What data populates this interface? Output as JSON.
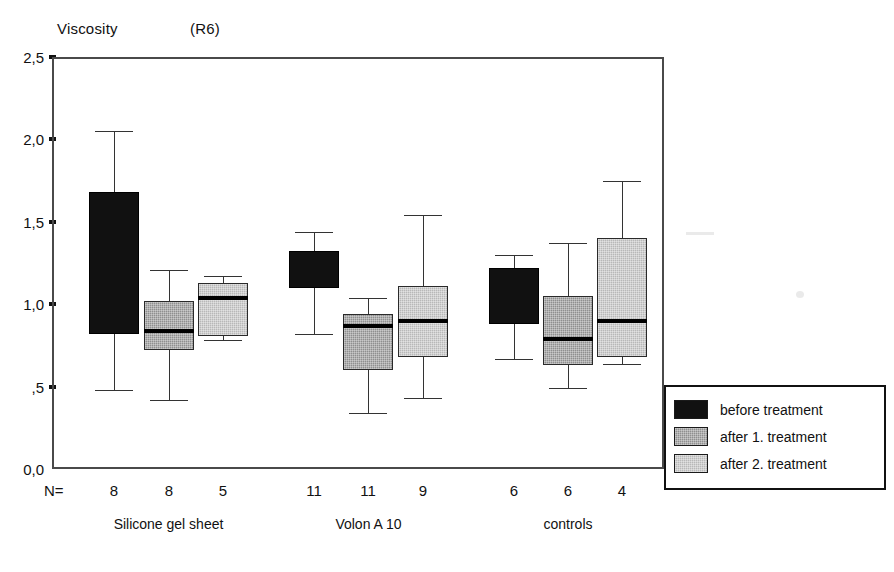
{
  "chart_data": {
    "type": "box",
    "title": "Viscosity",
    "title_suffix": "(R6)",
    "xlabel": "",
    "ylabel": "",
    "ylim": [
      0.0,
      2.5
    ],
    "ytick_labels": [
      "2,5",
      "2,0",
      "1,5",
      "1,0",
      ",5",
      "0,0"
    ],
    "ytick_values": [
      2.5,
      2.0,
      1.5,
      1.0,
      0.5,
      0.0
    ],
    "grid": false,
    "legend_position": "right",
    "n_row_label": "N=",
    "categories": [
      "Silicone gel sheet",
      "Volon A 10",
      "controls"
    ],
    "series": [
      {
        "name": "before treatment",
        "swatch": "dark"
      },
      {
        "name": "after 1. treatment",
        "swatch": "mid"
      },
      {
        "name": "after 2. treatment",
        "swatch": "light"
      }
    ],
    "boxes": [
      {
        "group": "Silicone gel sheet",
        "series": "before treatment",
        "n": "8",
        "whisker_low": 0.48,
        "q1": 0.82,
        "median": 0.82,
        "q3": 1.68,
        "whisker_high": 2.05,
        "style": "dark"
      },
      {
        "group": "Silicone gel sheet",
        "series": "after 1. treatment",
        "n": "8",
        "whisker_low": 0.42,
        "q1": 0.72,
        "median": 0.84,
        "q3": 1.02,
        "whisker_high": 1.21,
        "style": "mid"
      },
      {
        "group": "Silicone gel sheet",
        "series": "after 2. treatment",
        "n": "5",
        "whisker_low": 0.78,
        "q1": 0.81,
        "median": 1.04,
        "q3": 1.13,
        "whisker_high": 1.17,
        "style": "light"
      },
      {
        "group": "Volon A 10",
        "series": "before treatment",
        "n": "11",
        "whisker_low": 0.82,
        "q1": 1.1,
        "median": 1.17,
        "q3": 1.32,
        "whisker_high": 1.44,
        "style": "dark"
      },
      {
        "group": "Volon A 10",
        "series": "after 1. treatment",
        "n": "11",
        "whisker_low": 0.34,
        "q1": 0.6,
        "median": 0.87,
        "q3": 0.94,
        "whisker_high": 1.04,
        "style": "mid"
      },
      {
        "group": "Volon A 10",
        "series": "after 2. treatment",
        "n": "9",
        "whisker_low": 0.43,
        "q1": 0.68,
        "median": 0.9,
        "q3": 1.11,
        "whisker_high": 1.54,
        "style": "light"
      },
      {
        "group": "controls",
        "series": "before treatment",
        "n": "6",
        "whisker_low": 0.67,
        "q1": 0.88,
        "median": 0.94,
        "q3": 1.22,
        "whisker_high": 1.3,
        "style": "dark"
      },
      {
        "group": "controls",
        "series": "after 1. treatment",
        "n": "6",
        "whisker_low": 0.49,
        "q1": 0.63,
        "median": 0.79,
        "q3": 1.05,
        "whisker_high": 1.37,
        "style": "mid"
      },
      {
        "group": "controls",
        "series": "after 2. treatment",
        "n": "4",
        "whisker_low": 0.64,
        "q1": 0.68,
        "median": 0.9,
        "q3": 1.4,
        "whisker_high": 1.75,
        "style": "light"
      }
    ]
  }
}
